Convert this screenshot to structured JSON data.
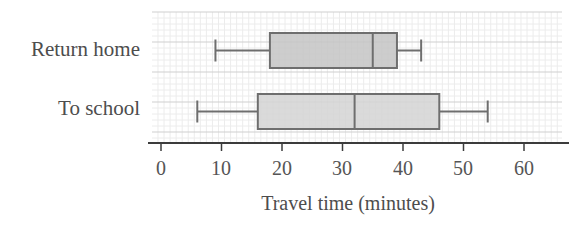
{
  "chart_data": {
    "type": "boxplot",
    "title": "",
    "xlabel": "Travel time (minutes)",
    "ylabel": "",
    "xlim": [
      0,
      60
    ],
    "x_ticks": [
      0,
      10,
      20,
      30,
      40,
      50,
      60
    ],
    "grid": true,
    "categories": [
      "Return home",
      "To school"
    ],
    "series": [
      {
        "name": "Return home",
        "min": 9,
        "q1": 18,
        "median": 35,
        "q3": 39,
        "max": 43,
        "fill": "#c4c4c4"
      },
      {
        "name": "To school",
        "min": 6,
        "q1": 16,
        "median": 32,
        "q3": 46,
        "max": 54,
        "fill": "#d3d3d3"
      }
    ]
  },
  "labels": {
    "return_home": "Return home",
    "to_school": "To school",
    "x_axis_title": "Travel time (minutes)",
    "ticks": [
      "0",
      "10",
      "20",
      "30",
      "40",
      "50",
      "60"
    ]
  },
  "colors": {
    "box_stroke": "#6e6e6e",
    "grid_major": "#cfcfcf",
    "grid_minor": "#ececec",
    "axis": "#3c3c3c"
  }
}
